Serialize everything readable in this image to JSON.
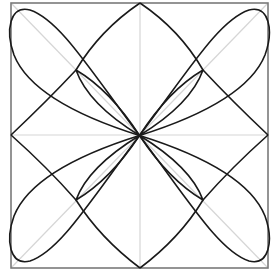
{
  "diagram": {
    "colors": {
      "background": "#ffffff",
      "frame": "#7a7a7a",
      "guides": "#d6d6d6",
      "curves": "#1a1a1a"
    },
    "geometry": {
      "square": {
        "x": 11,
        "y": 3,
        "width": 257,
        "height": 265
      },
      "center": [
        139.5,
        135.5
      ],
      "edge_midpoints": {
        "top": [
          140,
          3
        ],
        "right": [
          268,
          135
        ],
        "bottom": [
          140,
          268
        ],
        "left": [
          11,
          135
        ]
      },
      "inner_cusps": [
        [
          76,
          70
        ],
        [
          203,
          70
        ],
        [
          76,
          200
        ],
        [
          203,
          200
        ]
      ]
    },
    "elements": [
      "outer square frame",
      "diagonal guide lines",
      "vertical and horizontal center guide lines",
      "concave diamond connecting edge midpoints through inner cusps",
      "four large elliptical petals along diagonals",
      "four small lens petals between center and inner cusps"
    ]
  }
}
